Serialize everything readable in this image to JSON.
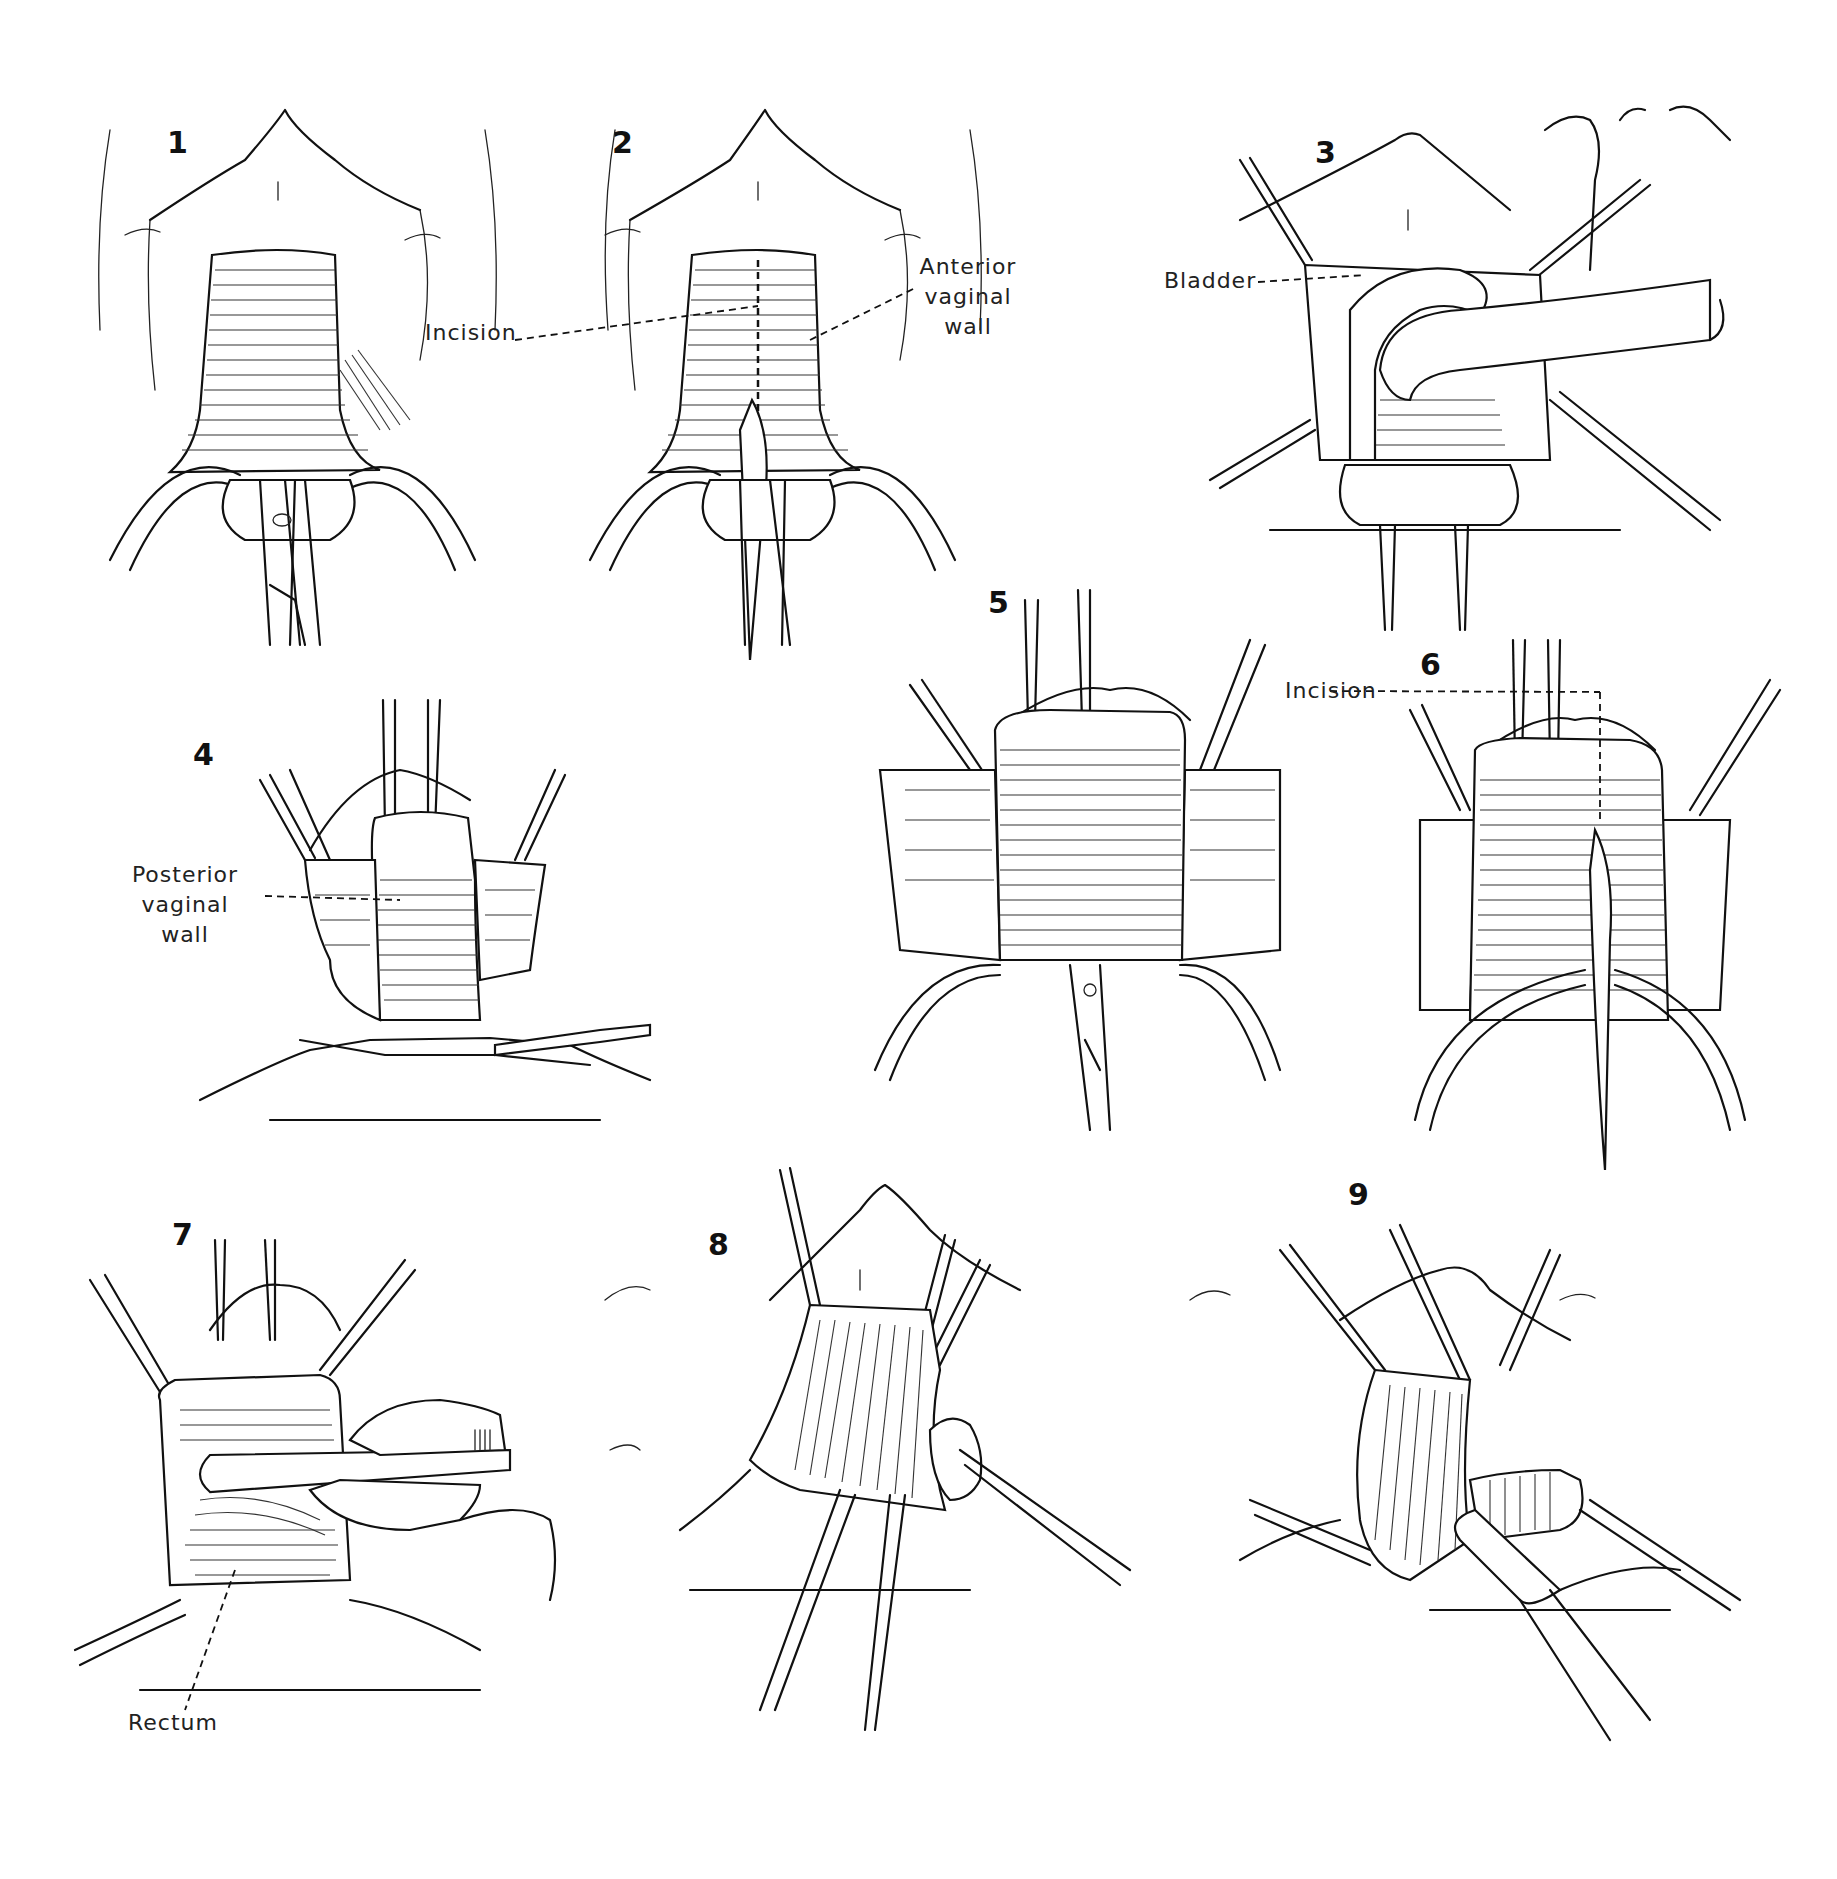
{
  "figure": {
    "type": "surgical illustration plate",
    "panel_count": 9,
    "line_color": "#111111",
    "background": "#ffffff"
  },
  "panels": [
    {
      "number": "1",
      "labels": []
    },
    {
      "number": "2",
      "labels": [
        {
          "text": "Incision",
          "lines": [
            "Incision"
          ]
        },
        {
          "text": "Anterior vaginal wall",
          "lines": [
            "Anterior",
            "vaginal",
            "wall"
          ]
        }
      ]
    },
    {
      "number": "3",
      "labels": [
        {
          "text": "Bladder",
          "lines": [
            "Bladder"
          ]
        }
      ]
    },
    {
      "number": "4",
      "labels": [
        {
          "text": "Posterior vaginal wall",
          "lines": [
            "Posterior",
            "vaginal",
            "wall"
          ]
        }
      ]
    },
    {
      "number": "5",
      "labels": []
    },
    {
      "number": "6",
      "labels": [
        {
          "text": "Incision",
          "lines": [
            "Incision"
          ]
        }
      ]
    },
    {
      "number": "7",
      "labels": [
        {
          "text": "Rectum",
          "lines": [
            "Rectum"
          ]
        }
      ]
    },
    {
      "number": "8",
      "labels": []
    },
    {
      "number": "9",
      "labels": []
    }
  ]
}
